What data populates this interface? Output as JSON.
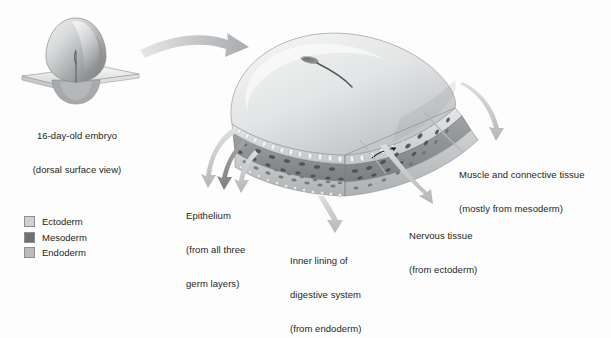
{
  "figure": {
    "title_region": "embryonic germ layer derivatives diagram",
    "embryo_caption": {
      "line1": "16-day-old embryo",
      "line2": "(dorsal surface view)"
    },
    "callouts": [
      {
        "name": "epithelium",
        "line1": "Epithelium",
        "line2": "(from all three",
        "line3": "germ layers)"
      },
      {
        "name": "inner-lining-digestive",
        "line1": "Inner lining of",
        "line2": "digestive system",
        "line3": "(from endoderm)"
      },
      {
        "name": "nervous-tissue",
        "line1": "Nervous tissue",
        "line2": "(from ectoderm)"
      },
      {
        "name": "muscle-connective",
        "line1": "Muscle and connective tissue",
        "line2": "(mostly from mesoderm)"
      }
    ],
    "legend": {
      "items": [
        {
          "label": "Ectoderm",
          "color": "#cfd1d2"
        },
        {
          "label": "Mesoderm",
          "color": "#6e7072"
        },
        {
          "label": "Endoderm",
          "color": "#b9bbbd"
        }
      ]
    },
    "colors": {
      "background": "#fdfdfd",
      "arrow_light": "#c9cbcd",
      "arrow_dark": "#8a8c8e",
      "outline": "#8d8f91",
      "text": "#231f20",
      "ectoderm": "#cfd1d2",
      "mesoderm": "#6e7072",
      "endoderm": "#b9bbbd"
    }
  }
}
